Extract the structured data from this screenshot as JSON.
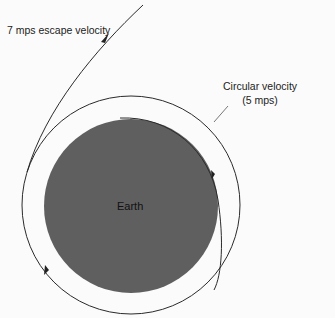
{
  "diagram": {
    "labels": {
      "escape": "7 mps escape velocity",
      "circular_line1": "Circular velocity",
      "circular_line2": "(5 mps)",
      "earth": "Earth"
    },
    "colors": {
      "earth_fill": "#5f5f5f",
      "line": "#2a2a2a",
      "background": "#fbfbfb"
    }
  }
}
